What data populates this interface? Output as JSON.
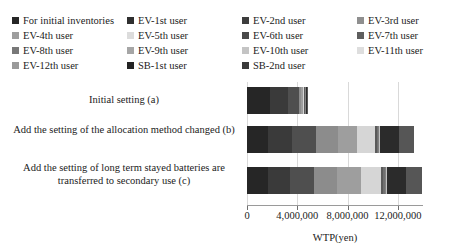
{
  "chart_data": {
    "type": "bar",
    "orientation": "horizontal",
    "stacked": true,
    "title": "",
    "xlabel": "WTP(yen)",
    "ylabel": "",
    "xlim": [
      0,
      14000000
    ],
    "xticks": [
      0,
      4000000,
      8000000,
      12000000
    ],
    "xtick_labels": [
      "0",
      "4,000,000",
      "8,000,000",
      "12,000,000"
    ],
    "grid": true,
    "legend_position": "top",
    "categories": [
      "Initial setting (a)",
      "Add the setting of the allocation method changed (b)",
      "Add the setting of long term stayed batteries are transferred to secondary use (c)"
    ],
    "series": [
      {
        "name": "For initial inventories",
        "color": "#262626",
        "values": [
          1800000,
          1700000,
          1700000
        ]
      },
      {
        "name": "EV-1st user",
        "color": "#3a3a3a",
        "values": [
          1500000,
          1900000,
          1750000
        ]
      },
      {
        "name": "EV-2nd user",
        "color": "#4f4f4f",
        "values": [
          800000,
          1900000,
          1850000
        ]
      },
      {
        "name": "EV-3rd user",
        "color": "#8c8c8c",
        "values": [
          220000,
          1750000,
          1900000
        ]
      },
      {
        "name": "EV-4th user",
        "color": "#9e9e9e",
        "values": [
          120000,
          1500000,
          1850000
        ]
      },
      {
        "name": "EV-5th user",
        "color": "#d6d6d6",
        "values": [
          90000,
          1450000,
          1600000
        ]
      },
      {
        "name": "EV-6th user",
        "color": "#5a5a5a",
        "values": [
          70000,
          150000,
          180000
        ]
      },
      {
        "name": "EV-7th user",
        "color": "#707070",
        "values": [
          40000,
          90000,
          120000
        ]
      },
      {
        "name": "EV-8th user",
        "color": "#808080",
        "values": [
          25000,
          60000,
          80000
        ]
      },
      {
        "name": "EV-9th user",
        "color": "#a8a8a8",
        "values": [
          15000,
          40000,
          55000
        ]
      },
      {
        "name": "EV-10th user",
        "color": "#c2c2c2",
        "values": [
          10000,
          25000,
          35000
        ]
      },
      {
        "name": "EV-11th user",
        "color": "#dcdcdc",
        "values": [
          8000,
          15000,
          25000
        ]
      },
      {
        "name": "EV-12th user",
        "color": "#9a9a9a",
        "values": [
          5000,
          10000,
          15000
        ]
      },
      {
        "name": "SB-1st user",
        "color": "#2b2b2b",
        "values": [
          60000,
          1500000,
          1500000
        ]
      },
      {
        "name": "SB-2nd user",
        "color": "#565656",
        "values": [
          30000,
          1200000,
          1250000
        ]
      }
    ],
    "totals": [
      4793000,
      13289000,
      13910000
    ]
  },
  "legend": {
    "items": [
      {
        "label": "For initial inventories",
        "color": "#262626"
      },
      {
        "label": "EV-1st user",
        "color": "#2f2f2f"
      },
      {
        "label": "EV-2nd user",
        "color": "#3d3d3d"
      },
      {
        "label": "EV-3rd user",
        "color": "#8f8f8f"
      },
      {
        "label": "EV-4th user",
        "color": "#9e9e9e"
      },
      {
        "label": "EV-5th user",
        "color": "#dcdcdc"
      },
      {
        "label": "EV-6th user",
        "color": "#4a4a4a"
      },
      {
        "label": "EV-7th user",
        "color": "#5e5e5e"
      },
      {
        "label": "EV-8th user",
        "color": "#787878"
      },
      {
        "label": "EV-9th user",
        "color": "#a6a6a6"
      },
      {
        "label": "EV-10th user",
        "color": "#c4c4c4"
      },
      {
        "label": "EV-11th user",
        "color": "#dedede"
      },
      {
        "label": "EV-12th user",
        "color": "#9a9a9a"
      },
      {
        "label": "SB-1st user",
        "color": "#232323"
      },
      {
        "label": "SB-2nd user",
        "color": "#3a3a3a"
      }
    ]
  }
}
